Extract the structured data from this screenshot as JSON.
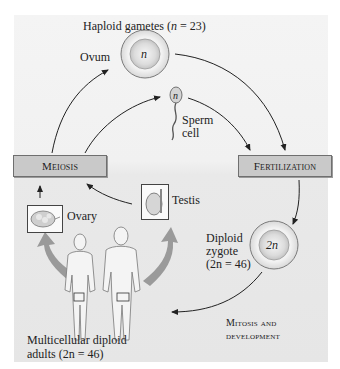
{
  "diagram": {
    "title": "Haploid gametes (n = 23)",
    "title_parts": [
      "Haploid gametes (",
      "n",
      " = 23)"
    ],
    "stages": {
      "meiosis": {
        "label": "Meiosis"
      },
      "fertilization": {
        "label": "Fertilization"
      }
    },
    "cells": {
      "ovum": {
        "label": "Ovum",
        "ploidy": "n"
      },
      "sperm": {
        "label_line1": "Sperm",
        "label_line2": "cell",
        "ploidy": "n"
      },
      "zygote": {
        "label_line1": "Diploid",
        "label_line2": "zygote",
        "label_line3": "(2n = 46)",
        "ploidy": "2n"
      }
    },
    "organs": {
      "ovary": {
        "label": "Ovary"
      },
      "testis": {
        "label": "Testis"
      }
    },
    "adults": {
      "label_line1": "Multicellular diploid",
      "label_line2": "adults (2n = 46)"
    },
    "process": {
      "label_line1": "Mitosis and",
      "label_line2": "development"
    },
    "colors": {
      "panel_bg": "#f1f1f1",
      "stage_box": "#c9c9c9",
      "arrow": "#222222",
      "big_arrow": "#8a8a8a"
    }
  }
}
